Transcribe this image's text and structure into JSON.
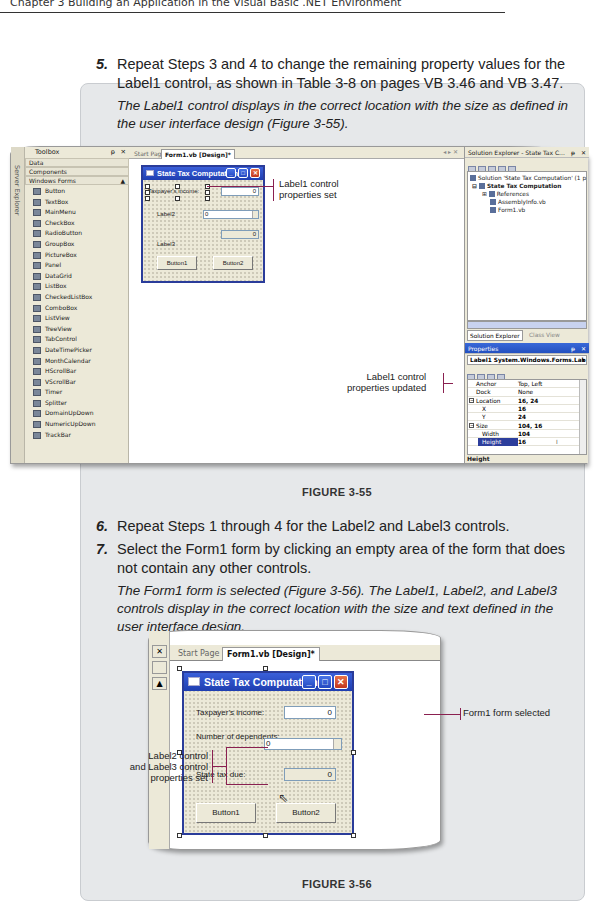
{
  "header": {
    "running_head": "Chapter 3 Building an Application in the Visual Basic .NET Environment"
  },
  "steps": [
    {
      "number": "5.",
      "text": "Repeat Steps 3 and 4 to change the remaining property values for the Label1 control, as shown in Table 3-8 on pages VB 3.46 and VB 3.47.",
      "line1": "Repeat Steps 3 and 4 to change the remaining property values for the",
      "line2": "Label1 control, as shown in Table 3-8 on pages VB 3.46 and VB 3.47.",
      "result_line1": "The Label1 control displays in the correct location with the size as defined in",
      "result_line2": "the user interface design (Figure 3-55)."
    },
    {
      "number": "6.",
      "line1": "Repeat Steps 1 through 4 for the Label2 and Label3 controls."
    },
    {
      "number": "7.",
      "line1": "Select the Form1 form by clicking an empty area of the form that does",
      "line2": "not contain any other controls.",
      "result_line1": "The Form1 form is selected (Figure 3-56). The Label1, Label2, and Label3",
      "result_line2": "controls display in the correct location with the size and text defined in the",
      "result_line3": "user interface design."
    }
  ],
  "figure55": {
    "caption": "FIGURE 3-55",
    "toolbox": {
      "title": "Toolbox",
      "pin": "ᵽ",
      "close": "✕",
      "server_explorer_tab": "Server Explorer",
      "categories": [
        "Data",
        "Components",
        "Windows Forms"
      ],
      "items": [
        "Button",
        "TextBox",
        "MainMenu",
        "CheckBox",
        "RadioButton",
        "GroupBox",
        "PictureBox",
        "Panel",
        "DataGrid",
        "ListBox",
        "CheckedListBox",
        "ComboBox",
        "ListView",
        "TreeView",
        "TabControl",
        "DateTimePicker",
        "MonthCalendar",
        "HScrollBar",
        "VScrollBar",
        "Timer",
        "Splitter",
        "DomainUpDown",
        "NumericUpDown",
        "TrackBar"
      ]
    },
    "tabs": {
      "start_page": "Start Page",
      "active": "Form1.vb [Design]*",
      "controls": "◂ ▸ ✕"
    },
    "form": {
      "title": "State Tax Computation",
      "label1": "Taxpayer's income:",
      "textbox1": "0",
      "label2": "Label2",
      "updown": "0",
      "textbox2": "0",
      "label3": "Label3",
      "button1": "Button1",
      "button2": "Button2"
    },
    "callout_top": {
      "line1": "Label1 control",
      "line2": "properties set"
    },
    "callout_bottom": {
      "line1": "Label1 control",
      "line2": "properties updated"
    },
    "solution_explorer": {
      "title": "Solution Explorer - State Tax C...",
      "tree": [
        "Solution 'State Tax Computation' (1 p",
        "State Tax Computation",
        "References",
        "AssemblyInfo.vb",
        "Form1.vb"
      ],
      "tab_solution": "Solution Explorer",
      "tab_class": "Class View"
    },
    "properties": {
      "title": "Properties",
      "object": "Label1  System.Windows.Forms.Lab",
      "rows": [
        {
          "key": "Anchor",
          "value": "Top, Left"
        },
        {
          "key": "Dock",
          "value": "None"
        },
        {
          "key": "Location",
          "value": "16, 24"
        },
        {
          "key": "X",
          "value": "16"
        },
        {
          "key": "Y",
          "value": "24"
        },
        {
          "key": "Size",
          "value": "104, 16"
        },
        {
          "key": "Width",
          "value": "104"
        },
        {
          "key": "Height",
          "value": "16"
        }
      ],
      "description": "Height"
    }
  },
  "figure56": {
    "caption": "FIGURE 3-56",
    "tabs": {
      "start_page": "Start Page",
      "active": "Form1.vb [Design]*"
    },
    "form": {
      "title": "State Tax Computation",
      "label1": "Taxpayer's income:",
      "textbox1": "0",
      "label2": "Number of dependents:",
      "updown": "0",
      "label3": "State tax due:",
      "textbox2": "0",
      "button1": "Button1",
      "button2": "Button2"
    },
    "callout_left": {
      "line1": "Label2 control",
      "line2": "and Label3 control",
      "line3": "properties set"
    },
    "callout_right": "Form1 form selected"
  },
  "colors": {
    "callout_line": "#8a2050",
    "title_bar": "#2448c1",
    "panel_bg": "#e6e8ea"
  }
}
